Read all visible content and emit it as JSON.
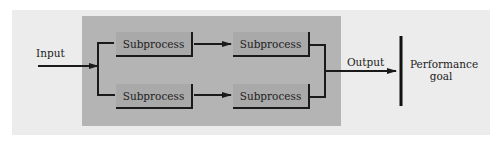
{
  "diagram": {
    "input_label": "Input",
    "output_label": "Output",
    "goal_label_line1": "Performance",
    "goal_label_line2": "goal",
    "subprocesses": [
      {
        "label": "Subprocess",
        "row": "top",
        "col": 1
      },
      {
        "label": "Subprocess",
        "row": "top",
        "col": 2
      },
      {
        "label": "Subprocess",
        "row": "bottom",
        "col": 1
      },
      {
        "label": "Subprocess",
        "row": "bottom",
        "col": 2
      }
    ],
    "colors": {
      "background": "#ffffff",
      "outer_panel": "#ececec",
      "process_panel": "#b4b4b4",
      "box": "#a9a9a9",
      "line": "#1a1a1a"
    }
  }
}
